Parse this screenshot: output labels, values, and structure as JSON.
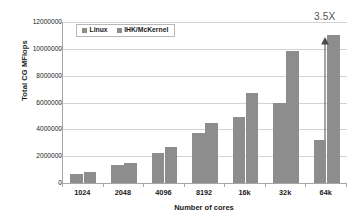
{
  "chart_data": {
    "type": "bar",
    "title": "",
    "xlabel": "Number of cores",
    "ylabel": "Total CG MFlops",
    "categories": [
      "1024",
      "2048",
      "4096",
      "8192",
      "16k",
      "32k",
      "64k"
    ],
    "series": [
      {
        "name": "Linux",
        "values": [
          700000,
          1350000,
          2230000,
          3700000,
          4930000,
          6000000,
          3220000
        ]
      },
      {
        "name": "IHK/McKernel",
        "values": [
          790000,
          1490000,
          2680000,
          4440000,
          6700000,
          9850000,
          11050000
        ]
      }
    ],
    "ylim": [
      0,
      12000000
    ],
    "yticks": [
      0,
      2000000,
      4000000,
      6000000,
      8000000,
      10000000,
      12000000
    ],
    "ytick_labels": [
      "0",
      "2000000",
      "4000000",
      "6000000",
      "8000000",
      "10000000",
      "12000000"
    ],
    "grid": true,
    "legend_position": "upper-left-inside",
    "annotations": [
      {
        "text": "3.5X",
        "category": "64k",
        "kind": "double-ended-arrow-up",
        "from": 3220000,
        "to": 11050000
      }
    ],
    "colors": {
      "series_0": "#8d8d8d",
      "series_1": "#8d8d8d",
      "grid": "#d2d2d2",
      "axis": "#a6a6a6",
      "text": "#1a1a1a",
      "annotation": "#555555"
    }
  }
}
